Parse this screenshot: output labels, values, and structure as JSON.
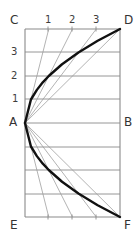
{
  "figure": {
    "background_color": "#ffffff",
    "grid_color": "#8a8a8a",
    "ray_color": "#9a9a9a",
    "curve_color": "#111111",
    "label_color": "#333333",
    "corner_labels": {
      "top_left": "C",
      "top_right": "D",
      "mid_left": "A",
      "mid_right": "B",
      "bottom_left": "E",
      "bottom_right": "F"
    },
    "top_axis_labels": [
      "1",
      "2",
      "3"
    ],
    "left_axis_labels": [
      "3",
      "2",
      "1"
    ]
  },
  "chart_data": {
    "type": "line",
    "xlabel": "",
    "ylabel": "",
    "xlim": [
      0,
      4
    ],
    "ylim": [
      -4,
      4
    ],
    "grid": true,
    "legend": "none",
    "frame": {
      "left": 25,
      "right": 120,
      "top": 29,
      "bottom": 217,
      "midline_y": 123
    },
    "horizontal_gridlines_y": [
      29,
      52,
      76,
      99,
      123,
      147,
      170,
      194,
      217
    ],
    "top_tick_x": [
      48,
      72,
      96
    ],
    "series": [
      {
        "name": "upper-parabola",
        "points": [
          [
            0,
            0
          ],
          [
            0.25,
            1
          ],
          [
            0.5,
            1.41
          ],
          [
            0.75,
            1.73
          ],
          [
            1,
            2
          ],
          [
            1.56,
            2.5
          ],
          [
            2.25,
            3
          ],
          [
            3.06,
            3.5
          ],
          [
            4,
            4
          ]
        ]
      },
      {
        "name": "lower-parabola",
        "points": [
          [
            0,
            0
          ],
          [
            0.25,
            -1
          ],
          [
            0.5,
            -1.41
          ],
          [
            0.75,
            -1.73
          ],
          [
            1,
            -2
          ],
          [
            1.56,
            -2.5
          ],
          [
            2.25,
            -3
          ],
          [
            3.06,
            -3.5
          ],
          [
            4,
            -4
          ]
        ]
      }
    ],
    "rays_from_origin": [
      {
        "name": "ray-A-to-1",
        "to": [
          1,
          4
        ]
      },
      {
        "name": "ray-A-to-2",
        "to": [
          2,
          4
        ]
      },
      {
        "name": "ray-A-to-3",
        "to": [
          3,
          4
        ]
      },
      {
        "name": "ray-A-to-D",
        "to": [
          4,
          4
        ]
      },
      {
        "name": "ray-A-to-1-lower",
        "to": [
          1,
          -4
        ]
      },
      {
        "name": "ray-A-to-2-lower",
        "to": [
          2,
          -4
        ]
      },
      {
        "name": "ray-A-to-3-lower",
        "to": [
          3,
          -4
        ]
      },
      {
        "name": "ray-A-to-F",
        "to": [
          4,
          -4
        ]
      }
    ]
  }
}
